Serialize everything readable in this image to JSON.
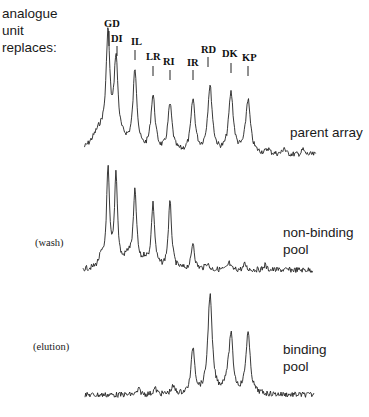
{
  "header": {
    "lines": [
      "analogue",
      "unit",
      "replaces:"
    ]
  },
  "traces": [
    {
      "id": "parent",
      "side_label": "",
      "pool_label_lines": [
        "parent array"
      ]
    },
    {
      "id": "wash",
      "side_label": "(wash)",
      "pool_label_lines": [
        "non-binding",
        "pool"
      ]
    },
    {
      "id": "elution",
      "side_label": "(elution)",
      "pool_label_lines": [
        "binding",
        "pool"
      ]
    }
  ],
  "peak_labels": [
    "GD",
    "DI",
    "IL",
    "LR",
    "RI",
    "IR",
    "RD",
    "DK",
    "KP"
  ],
  "chart_data": {
    "type": "line",
    "title": "",
    "xlabel": "",
    "ylabel": "",
    "grid": false,
    "legend": "none (traces labelled on right)",
    "categories": [
      "GD",
      "DI",
      "IL",
      "LR",
      "RI",
      "IR",
      "RD",
      "DK",
      "KP"
    ],
    "peak_x_px": [
      108,
      116,
      135,
      153,
      170,
      193,
      210,
      231,
      248
    ],
    "series": [
      {
        "name": "parent array",
        "condition": "",
        "baseline_y_px": 155,
        "relative_peak_heights": [
          1.0,
          0.79,
          0.75,
          0.53,
          0.45,
          0.5,
          0.63,
          0.57,
          0.51
        ],
        "minor_bumps_x_px": [
          268,
          284,
          303
        ]
      },
      {
        "name": "non-binding pool",
        "condition": "(wash)",
        "baseline_y_px": 270,
        "relative_peak_heights": [
          1.0,
          0.96,
          0.76,
          0.66,
          0.69,
          0.28,
          0.0,
          0.0,
          0.0
        ]
      },
      {
        "name": "binding pool",
        "condition": "(elution)",
        "baseline_y_px": 395,
        "relative_peak_heights": [
          0.0,
          0.0,
          0.0,
          0.0,
          0.0,
          0.47,
          1.0,
          0.56,
          0.62
        ]
      }
    ],
    "annotation": "analogue unit replaces:"
  }
}
